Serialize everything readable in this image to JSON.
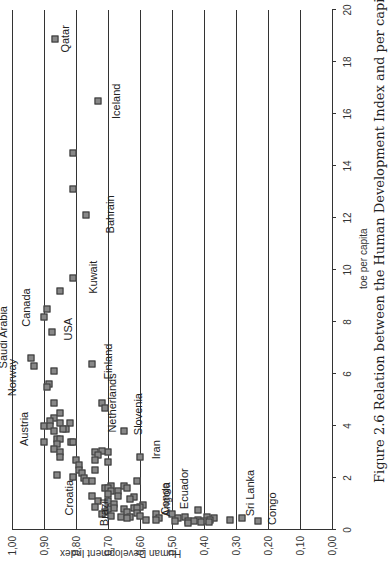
{
  "chart_data": {
    "type": "scatter",
    "title": "Figure 2.6  Relation between the Human Development Index and per capita energy use (2008)",
    "xlabel": "toe per capita",
    "ylabel": "Human Development Index",
    "xlim": [
      0,
      20
    ],
    "ylim": [
      0.0,
      1.0
    ],
    "x_ticks": [
      "0",
      "2",
      "4",
      "6",
      "8",
      "10",
      "12",
      "14",
      "16",
      "18",
      "20"
    ],
    "y_ticks": [
      "0,00",
      "0,10",
      "0,20",
      "0,30",
      "0,40",
      "0,50",
      "0,60",
      "0,70",
      "0,80",
      "0,90",
      "1,00"
    ],
    "grid": "horizontal",
    "rotation": "page rotated 90 degrees counter-clockwise",
    "labeled_points": [
      {
        "name": "Qatar",
        "x": 18.9,
        "y": 0.866
      },
      {
        "name": "Iceland",
        "x": 16.5,
        "y": 0.73
      },
      {
        "name": "Bahrain",
        "x": 12.1,
        "y": 0.77
      },
      {
        "name": "Kuwait",
        "x": 9.7,
        "y": 0.81
      },
      {
        "name": "USA",
        "x": 7.6,
        "y": 0.875
      },
      {
        "name": "Canada",
        "x": 8.2,
        "y": 0.9
      },
      {
        "name": "Saudi Arabia",
        "x": 6.6,
        "y": 0.94
      },
      {
        "name": "Norway",
        "x": 6.3,
        "y": 0.93
      },
      {
        "name": "Finland",
        "x": 6.4,
        "y": 0.75
      },
      {
        "name": "Netherlands",
        "x": 4.9,
        "y": 0.72
      },
      {
        "name": "Austria",
        "x": 4.0,
        "y": 0.9
      },
      {
        "name": "Slovenia",
        "x": 3.8,
        "y": 0.65
      },
      {
        "name": "Iran",
        "x": 2.8,
        "y": 0.6
      },
      {
        "name": "Croatia",
        "x": 2.1,
        "y": 0.86
      },
      {
        "name": "Brazil",
        "x": 1.3,
        "y": 0.75
      },
      {
        "name": "Angola",
        "x": 0.6,
        "y": 0.55
      },
      {
        "name": "Congo",
        "x": 0.5,
        "y": 0.46
      },
      {
        "name": "Ecuador",
        "x": 0.8,
        "y": 0.42
      },
      {
        "name": "Sri Lanka",
        "x": 0.45,
        "y": 0.28
      },
      {
        "name": "Congo",
        "x": 0.35,
        "y": 0.23
      }
    ],
    "points": [
      [
        18.9,
        0.866
      ],
      [
        16.5,
        0.73
      ],
      [
        14.5,
        0.81
      ],
      [
        13.1,
        0.81
      ],
      [
        12.1,
        0.77
      ],
      [
        9.7,
        0.81
      ],
      [
        9.2,
        0.85
      ],
      [
        8.5,
        0.89
      ],
      [
        8.2,
        0.9
      ],
      [
        7.6,
        0.875
      ],
      [
        6.6,
        0.94
      ],
      [
        6.3,
        0.93
      ],
      [
        6.4,
        0.75
      ],
      [
        6.1,
        0.87
      ],
      [
        5.6,
        0.885
      ],
      [
        5.5,
        0.89
      ],
      [
        4.9,
        0.72
      ],
      [
        4.7,
        0.71
      ],
      [
        4.9,
        0.87
      ],
      [
        4.5,
        0.85
      ],
      [
        4.3,
        0.87
      ],
      [
        4.2,
        0.88
      ],
      [
        4.1,
        0.85
      ],
      [
        4.1,
        0.82
      ],
      [
        4.0,
        0.9
      ],
      [
        4.0,
        0.88
      ],
      [
        3.9,
        0.83
      ],
      [
        3.9,
        0.84
      ],
      [
        3.8,
        0.87
      ],
      [
        3.8,
        0.65
      ],
      [
        3.5,
        0.86
      ],
      [
        3.5,
        0.85
      ],
      [
        3.4,
        0.9
      ],
      [
        3.4,
        0.815
      ],
      [
        3.4,
        0.81
      ],
      [
        3.3,
        0.86
      ],
      [
        3.1,
        0.87
      ],
      [
        3.0,
        0.85
      ],
      [
        3.0,
        0.74
      ],
      [
        3.0,
        0.7
      ],
      [
        3.05,
        0.72
      ],
      [
        2.9,
        0.73
      ],
      [
        2.8,
        0.85
      ],
      [
        2.8,
        0.6
      ],
      [
        2.7,
        0.8
      ],
      [
        2.7,
        0.74
      ],
      [
        2.6,
        0.7
      ],
      [
        2.5,
        0.79
      ],
      [
        2.3,
        0.79
      ],
      [
        2.3,
        0.74
      ],
      [
        2.2,
        0.78
      ],
      [
        2.1,
        0.86
      ],
      [
        2.05,
        0.81
      ],
      [
        2.0,
        0.775
      ],
      [
        1.9,
        0.77
      ],
      [
        1.9,
        0.75
      ],
      [
        1.9,
        0.61
      ],
      [
        1.7,
        0.69
      ],
      [
        1.7,
        0.65
      ],
      [
        1.6,
        0.71
      ],
      [
        1.6,
        0.7
      ],
      [
        1.6,
        0.64
      ],
      [
        1.5,
        0.69
      ],
      [
        1.5,
        0.67
      ],
      [
        1.4,
        0.7
      ],
      [
        1.3,
        0.75
      ],
      [
        1.3,
        0.67
      ],
      [
        1.25,
        0.62
      ],
      [
        1.2,
        0.63
      ],
      [
        1.1,
        0.7
      ],
      [
        1.1,
        0.73
      ],
      [
        1.0,
        0.68
      ],
      [
        0.95,
        0.59
      ],
      [
        0.9,
        0.74
      ],
      [
        0.9,
        0.6
      ],
      [
        0.85,
        0.68
      ],
      [
        0.85,
        0.62
      ],
      [
        0.85,
        0.61
      ],
      [
        0.8,
        0.7
      ],
      [
        0.8,
        0.65
      ],
      [
        0.75,
        0.42
      ],
      [
        0.7,
        0.71
      ],
      [
        0.7,
        0.64
      ],
      [
        0.65,
        0.61
      ],
      [
        0.6,
        0.72
      ],
      [
        0.6,
        0.55
      ],
      [
        0.6,
        0.5
      ],
      [
        0.55,
        0.69
      ],
      [
        0.55,
        0.6
      ],
      [
        0.5,
        0.66
      ],
      [
        0.5,
        0.63
      ],
      [
        0.5,
        0.46
      ],
      [
        0.5,
        0.39
      ],
      [
        0.45,
        0.64
      ],
      [
        0.45,
        0.54
      ],
      [
        0.45,
        0.48
      ],
      [
        0.45,
        0.37
      ],
      [
        0.45,
        0.28
      ],
      [
        0.4,
        0.58
      ],
      [
        0.4,
        0.42
      ],
      [
        0.4,
        0.38
      ],
      [
        0.4,
        0.32
      ],
      [
        0.38,
        0.55
      ],
      [
        0.35,
        0.49
      ],
      [
        0.35,
        0.45
      ],
      [
        0.35,
        0.43
      ],
      [
        0.35,
        0.4
      ],
      [
        0.35,
        0.23
      ],
      [
        0.3,
        0.41
      ],
      [
        0.3,
        0.385
      ],
      [
        0.25,
        0.45
      ]
    ]
  },
  "axis": {
    "xlabel": "toe per capita",
    "ylabel": "Human Development Index"
  },
  "caption": "Figure 2.6  Relation between the Human Development Index and per capita energy use (2008)"
}
